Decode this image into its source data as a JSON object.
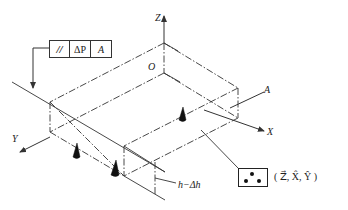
{
  "diagram": {
    "type": "isometric measurement setup diagram",
    "axes": {
      "z_label": "Z",
      "x_label": "X",
      "y_label": "Y",
      "origin_label": "O"
    },
    "datum_label": "A",
    "feature_control_frame": {
      "symbol": "//",
      "symbol_meaning": "parallelism",
      "tolerance": "ΔP",
      "datum": "A"
    },
    "height_label": "h−Δh",
    "support_symbol": {
      "dots": 3,
      "constraint_text": "( Z⃗, X̂, Ŷ )",
      "constraints": [
        "Z⃗",
        "X̂",
        "Ŷ"
      ]
    },
    "support_points": 3,
    "line_color": "#333333"
  }
}
